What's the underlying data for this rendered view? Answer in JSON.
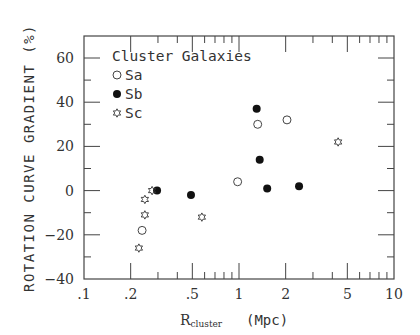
{
  "chart_data": {
    "type": "scatter",
    "title": "",
    "xlabel": "R_cluster (Mpc)",
    "xlabel_main": "R",
    "xlabel_sub": "cluster",
    "xlabel_unit": "(Mpc)",
    "ylabel": "ROTATION CURVE GRADIENT (%)",
    "xscale": "log",
    "xlim": [
      0.1,
      10
    ],
    "ylim": [
      -40,
      70
    ],
    "xticks": [
      0.1,
      0.2,
      0.5,
      1,
      2,
      5,
      10
    ],
    "xtick_labels": [
      ".1",
      ".2",
      ".5",
      "1",
      "2",
      "5",
      "10"
    ],
    "yticks": [
      -40,
      -20,
      0,
      20,
      40,
      60
    ],
    "ytick_labels": [
      "-40",
      "-20",
      "0",
      "20",
      "40",
      "60"
    ],
    "grid": false,
    "legend": {
      "title": "Cluster Galaxies",
      "position": "upper left",
      "entries": [
        {
          "label": "Sa",
          "marker": "open-circle"
        },
        {
          "label": "Sb",
          "marker": "filled-circle"
        },
        {
          "label": "Sc",
          "marker": "star"
        }
      ]
    },
    "series": [
      {
        "name": "Sa",
        "marker": "open-circle",
        "points": [
          {
            "x": 0.237,
            "y": -18
          },
          {
            "x": 0.98,
            "y": 4
          },
          {
            "x": 1.32,
            "y": 30
          },
          {
            "x": 2.04,
            "y": 32
          }
        ]
      },
      {
        "name": "Sb",
        "marker": "filled-circle",
        "points": [
          {
            "x": 0.296,
            "y": 0
          },
          {
            "x": 0.49,
            "y": -2
          },
          {
            "x": 1.3,
            "y": 37
          },
          {
            "x": 1.36,
            "y": 14
          },
          {
            "x": 1.52,
            "y": 1
          },
          {
            "x": 2.44,
            "y": 2
          }
        ]
      },
      {
        "name": "Sc",
        "marker": "star",
        "points": [
          {
            "x": 0.226,
            "y": -26
          },
          {
            "x": 0.247,
            "y": -11
          },
          {
            "x": 0.247,
            "y": -4
          },
          {
            "x": 0.275,
            "y": 0
          },
          {
            "x": 0.576,
            "y": -12
          },
          {
            "x": 4.36,
            "y": 22
          }
        ]
      }
    ]
  }
}
